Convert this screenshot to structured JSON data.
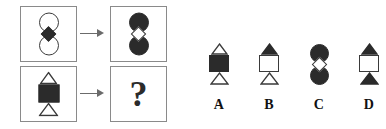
{
  "puzzle": {
    "type": "visual-analogy-matrix",
    "arrow_glyph": "rightwards-arrow",
    "panels": [
      {
        "id": "top-left",
        "role": "source",
        "shapes": [
          {
            "shape": "circle",
            "fill": "light"
          },
          {
            "shape": "diamond",
            "fill": "dark"
          },
          {
            "shape": "circle",
            "fill": "light"
          }
        ]
      },
      {
        "id": "top-right",
        "role": "result",
        "shapes": [
          {
            "shape": "circle",
            "fill": "dark"
          },
          {
            "shape": "diamond",
            "fill": "light"
          },
          {
            "shape": "circle",
            "fill": "dark"
          }
        ]
      },
      {
        "id": "bottom-left",
        "role": "source",
        "shapes": [
          {
            "shape": "triangle-up",
            "fill": "light"
          },
          {
            "shape": "square",
            "fill": "dark"
          },
          {
            "shape": "triangle-up",
            "fill": "light"
          }
        ]
      },
      {
        "id": "bottom-right",
        "role": "unknown",
        "question_mark": "?"
      }
    ]
  },
  "options": [
    {
      "label": "A",
      "shapes": [
        {
          "shape": "triangle-up",
          "fill": "light"
        },
        {
          "shape": "square",
          "fill": "dark"
        },
        {
          "shape": "triangle-up",
          "fill": "light"
        }
      ]
    },
    {
      "label": "B",
      "shapes": [
        {
          "shape": "triangle-up",
          "fill": "dark"
        },
        {
          "shape": "square",
          "fill": "light"
        },
        {
          "shape": "triangle-up",
          "fill": "light"
        }
      ]
    },
    {
      "label": "C",
      "shapes": [
        {
          "shape": "circle",
          "fill": "dark"
        },
        {
          "shape": "diamond",
          "fill": "light"
        },
        {
          "shape": "circle",
          "fill": "dark"
        }
      ]
    },
    {
      "label": "D",
      "shapes": [
        {
          "shape": "triangle-up",
          "fill": "dark"
        },
        {
          "shape": "square",
          "fill": "light"
        },
        {
          "shape": "triangle-up",
          "fill": "dark"
        }
      ]
    }
  ],
  "colors": {
    "dark_fill": "#2b2b2b",
    "light_fill": "#ffffff",
    "outline": "#3a3a3a",
    "panel_border": "#8a8a8a",
    "arrow": "#6b6b6b",
    "background": "#ffffff"
  }
}
